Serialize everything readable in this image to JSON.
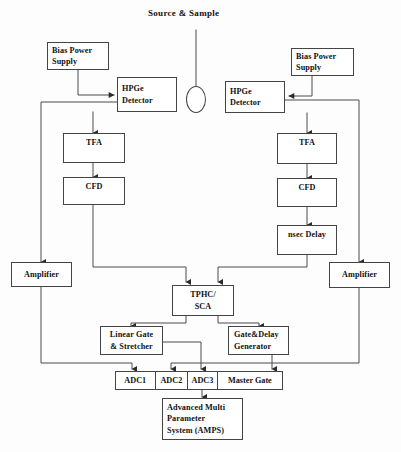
{
  "diagram": {
    "title": "Source & Sample",
    "source_label": "Source & Sample",
    "nodes": {
      "bias_left": "Bias Power Supply",
      "bias_left_line1": "Bias Power",
      "bias_left_line2": "Supply",
      "bias_right_line1": "Bias Power",
      "bias_right_line2": "Supply",
      "hpge_left_line1": "HPGe",
      "hpge_left_line2": "Detector",
      "hpge_right_line1": "HPGe",
      "hpge_right_line2": "Detector",
      "tfa_left": "TFA",
      "tfa_right": "TFA",
      "cfd_left": "CFD",
      "cfd_right": "CFD",
      "nsec_delay": "nsec Delay",
      "amplifier_left": "Amplifier",
      "amplifier_right": "Amplifier",
      "tphc_line1": "TPHC/",
      "tphc_line2": "SCA",
      "linear_gate_line1": "Linear Gate",
      "linear_gate_line2": "& Stretcher",
      "gate_delay_line1": "Gate&Delay",
      "gate_delay_line2": "Generator",
      "amps_line1": "Advanced Multi",
      "amps_line2": "Parameter",
      "amps_line3": "System (AMPS)"
    },
    "adc_row": [
      {
        "label": "ADC1"
      },
      {
        "label": "ADC2"
      },
      {
        "label": "ADC3"
      },
      {
        "label": "Master Gate"
      }
    ],
    "colors": {
      "line": "#444444",
      "text": "#111111",
      "background": "#ffffff"
    }
  }
}
